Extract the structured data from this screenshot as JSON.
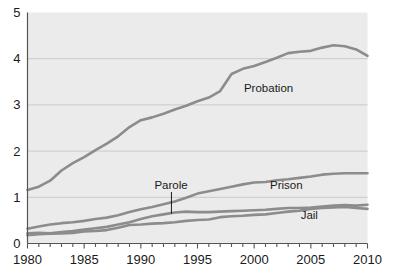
{
  "chart_data": {
    "type": "line",
    "title": "",
    "subtitle": "",
    "xlabel": "",
    "ylabel": "",
    "xlim": [
      1980,
      2010
    ],
    "ylim": [
      0,
      5
    ],
    "grid": "horizontal",
    "legend_position": "inline-labels",
    "x_ticks": [
      1980,
      1985,
      1990,
      1995,
      2000,
      2005,
      2010
    ],
    "x_tick_labels": [
      "1980",
      "1985",
      "1990",
      "1995",
      "2000",
      "2005",
      "2010"
    ],
    "x_minor_tick_interval": 1,
    "y_ticks": [
      0,
      1,
      2,
      3,
      4,
      5
    ],
    "y_tick_labels": [
      "0",
      "1",
      "2",
      "3",
      "4",
      "5"
    ],
    "x": [
      1980,
      1981,
      1982,
      1983,
      1984,
      1985,
      1986,
      1987,
      1988,
      1989,
      1990,
      1991,
      1992,
      1993,
      1994,
      1995,
      1996,
      1997,
      1998,
      1999,
      2000,
      2001,
      2002,
      2003,
      2004,
      2005,
      2006,
      2007,
      2008,
      2009,
      2010
    ],
    "series": [
      {
        "name": "Probation",
        "label": "Probation",
        "color": "#8c8c8c",
        "values": [
          1.16,
          1.23,
          1.36,
          1.58,
          1.74,
          1.87,
          2.02,
          2.16,
          2.32,
          2.52,
          2.67,
          2.73,
          2.81,
          2.9,
          2.98,
          3.08,
          3.16,
          3.3,
          3.67,
          3.78,
          3.84,
          3.93,
          4.02,
          4.12,
          4.15,
          4.17,
          4.24,
          4.29,
          4.27,
          4.2,
          4.06
        ]
      },
      {
        "name": "Prison",
        "label": "Prison",
        "color": "#8c8c8c",
        "values": [
          0.32,
          0.37,
          0.41,
          0.44,
          0.46,
          0.49,
          0.53,
          0.56,
          0.61,
          0.68,
          0.74,
          0.79,
          0.85,
          0.91,
          0.99,
          1.08,
          1.13,
          1.18,
          1.23,
          1.28,
          1.32,
          1.33,
          1.37,
          1.39,
          1.42,
          1.45,
          1.49,
          1.51,
          1.52,
          1.52,
          1.52
        ]
      },
      {
        "name": "Parole",
        "label": "Parole",
        "color": "#8c8c8c",
        "values": [
          0.22,
          0.23,
          0.22,
          0.25,
          0.27,
          0.3,
          0.33,
          0.36,
          0.41,
          0.46,
          0.53,
          0.59,
          0.63,
          0.67,
          0.69,
          0.68,
          0.68,
          0.69,
          0.7,
          0.71,
          0.72,
          0.73,
          0.75,
          0.77,
          0.77,
          0.78,
          0.8,
          0.82,
          0.83,
          0.82,
          0.84
        ]
      },
      {
        "name": "Jail",
        "label": "Jail",
        "color": "#8c8c8c",
        "values": [
          0.18,
          0.2,
          0.21,
          0.22,
          0.23,
          0.26,
          0.27,
          0.29,
          0.34,
          0.4,
          0.41,
          0.43,
          0.44,
          0.46,
          0.49,
          0.51,
          0.52,
          0.57,
          0.59,
          0.6,
          0.62,
          0.63,
          0.66,
          0.69,
          0.71,
          0.75,
          0.77,
          0.78,
          0.79,
          0.77,
          0.75
        ]
      }
    ],
    "annotations": [
      {
        "name": "probation-label",
        "text": "Probation",
        "x": 1999.1,
        "y": 3.28
      },
      {
        "name": "prison-label",
        "text": "Prison",
        "x": 2001.4,
        "y": 1.17
      },
      {
        "name": "jail-label",
        "text": "Jail",
        "x": 2004.1,
        "y": 0.53
      },
      {
        "name": "parole-label",
        "text": "Parole",
        "x": 1991.2,
        "y": 1.18,
        "leader_to_x": 1992.7,
        "leader_to_y": 0.645
      }
    ],
    "colors": {
      "plot_background": "#ebebeb",
      "grid_line": "#c9c9c9",
      "axis_line": "#555555",
      "tick_label": "#1a1a1a",
      "series_line": "#8c8c8c",
      "page_background": "#ffffff"
    }
  }
}
